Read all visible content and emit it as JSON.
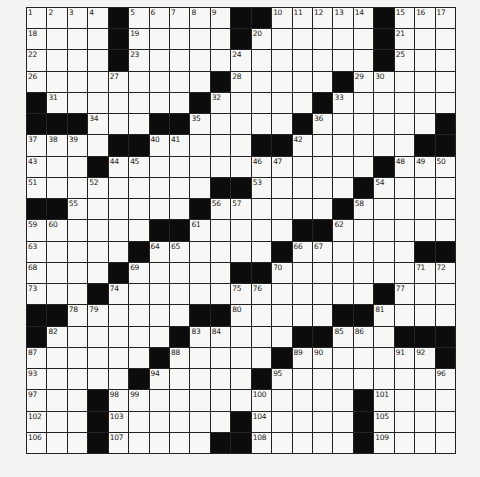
{
  "puzzle": {
    "rows": 21,
    "cols": 21,
    "grid": [
      [
        "1",
        "2",
        "3",
        "4",
        "#",
        "5",
        "6",
        "7",
        "8",
        "9",
        "#",
        "#",
        "10",
        "11",
        "12",
        "13",
        "14",
        "#",
        "15",
        "16",
        "17"
      ],
      [
        "18",
        ".",
        ".",
        ".",
        "#",
        "19",
        ".",
        ".",
        ".",
        ".",
        "#",
        "20",
        ".",
        ".",
        ".",
        ".",
        ".",
        "#",
        "21",
        ".",
        "."
      ],
      [
        "22",
        ".",
        ".",
        ".",
        "#",
        "23",
        ".",
        ".",
        ".",
        ".",
        "24",
        ".",
        ".",
        ".",
        ".",
        ".",
        ".",
        "#",
        "25",
        ".",
        "."
      ],
      [
        "26",
        ".",
        ".",
        ".",
        "27",
        ".",
        ".",
        ".",
        ".",
        "#",
        "28",
        ".",
        ".",
        ".",
        ".",
        "#",
        "29",
        "30",
        ".",
        ".",
        "."
      ],
      [
        "#",
        "31",
        ".",
        ".",
        ".",
        ".",
        ".",
        ".",
        "#",
        "32",
        ".",
        ".",
        ".",
        ".",
        "#",
        "33",
        ".",
        ".",
        ".",
        ".",
        "."
      ],
      [
        "#",
        "#",
        "#",
        "34",
        ".",
        ".",
        "#",
        "#",
        "35",
        ".",
        ".",
        ".",
        ".",
        "#",
        "36",
        ".",
        ".",
        ".",
        ".",
        ".",
        "#"
      ],
      [
        "37",
        "38",
        "39",
        ".",
        "#",
        "#",
        "40",
        "41",
        ".",
        ".",
        ".",
        "#",
        "#",
        "42",
        ".",
        ".",
        ".",
        ".",
        ".",
        "#",
        "#"
      ],
      [
        "43",
        ".",
        ".",
        "#",
        "44",
        "45",
        ".",
        ".",
        ".",
        ".",
        ".",
        "46",
        "47",
        ".",
        ".",
        ".",
        ".",
        "#",
        "48",
        "49",
        "50"
      ],
      [
        "51",
        ".",
        ".",
        "52",
        ".",
        ".",
        ".",
        ".",
        ".",
        "#",
        "#",
        "53",
        ".",
        ".",
        ".",
        ".",
        "#",
        "54",
        ".",
        ".",
        "."
      ],
      [
        "#",
        "#",
        "55",
        ".",
        ".",
        ".",
        ".",
        ".",
        "#",
        "56",
        "57",
        ".",
        ".",
        ".",
        ".",
        "#",
        "58",
        ".",
        ".",
        ".",
        "."
      ],
      [
        "59",
        "60",
        ".",
        ".",
        ".",
        ".",
        "#",
        "#",
        "61",
        ".",
        ".",
        ".",
        ".",
        "#",
        "#",
        "62",
        ".",
        ".",
        ".",
        ".",
        "."
      ],
      [
        "63",
        ".",
        ".",
        ".",
        ".",
        "#",
        "64",
        "65",
        ".",
        ".",
        ".",
        ".",
        "#",
        "66",
        "67",
        ".",
        ".",
        ".",
        ".",
        "#",
        "#"
      ],
      [
        "68",
        ".",
        ".",
        ".",
        "#",
        "69",
        ".",
        ".",
        ".",
        ".",
        "#",
        "#",
        "70",
        ".",
        ".",
        ".",
        ".",
        ".",
        ".",
        "71",
        "72"
      ],
      [
        "73",
        ".",
        ".",
        "#",
        "74",
        ".",
        ".",
        ".",
        ".",
        ".",
        "75",
        "76",
        ".",
        ".",
        ".",
        ".",
        ".",
        "#",
        "77",
        ".",
        "."
      ],
      [
        "#",
        "#",
        "78",
        "79",
        ".",
        ".",
        ".",
        ".",
        "#",
        "#",
        "80",
        ".",
        ".",
        ".",
        ".",
        "#",
        "#",
        "81",
        ".",
        ".",
        "."
      ],
      [
        "#",
        "82",
        ".",
        ".",
        ".",
        ".",
        ".",
        "#",
        "83",
        "84",
        ".",
        ".",
        ".",
        "#",
        "#",
        "85",
        "86",
        ".",
        "#",
        "#",
        "#"
      ],
      [
        "87",
        ".",
        ".",
        ".",
        ".",
        ".",
        "#",
        "88",
        ".",
        ".",
        ".",
        ".",
        "#",
        "89",
        "90",
        ".",
        ".",
        ".",
        "91",
        "92",
        "#"
      ],
      [
        "93",
        ".",
        ".",
        ".",
        ".",
        "#",
        "94",
        ".",
        ".",
        ".",
        ".",
        "#",
        "95",
        ".",
        ".",
        ".",
        ".",
        ".",
        ".",
        ".",
        "96"
      ],
      [
        "97",
        ".",
        ".",
        "#",
        "98",
        "99",
        ".",
        ".",
        ".",
        ".",
        ".",
        "100",
        ".",
        ".",
        ".",
        ".",
        "#",
        "101",
        ".",
        ".",
        "."
      ],
      [
        "102",
        ".",
        ".",
        "#",
        "103",
        ".",
        ".",
        ".",
        ".",
        ".",
        "#",
        "104",
        ".",
        ".",
        ".",
        ".",
        "#",
        "105",
        ".",
        ".",
        "."
      ],
      [
        "106",
        ".",
        ".",
        "#",
        "107",
        ".",
        ".",
        ".",
        ".",
        "#",
        "#",
        "108",
        ".",
        ".",
        ".",
        ".",
        "#",
        "109",
        ".",
        ".",
        "."
      ]
    ]
  },
  "colors": {
    "background": "#f3f3f1",
    "cell": "#f7f7f5",
    "block": "#0c0c0c",
    "line": "#222222"
  }
}
